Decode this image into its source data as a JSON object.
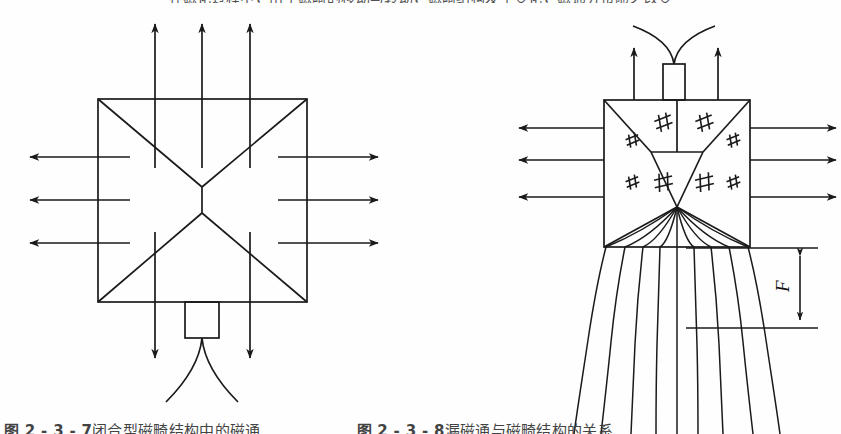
{
  "document": {
    "type": "scanned-figure",
    "page_background": "#fefefe",
    "ink_color": "#1a1a1a"
  },
  "clipped_text": {
    "top_row": "在磁化过程中，由于磁畸的移动与转动，磁畸结构发生变化，磁通分布随之改变",
    "bottom_row_left": "图 2 - 3 - 7",
    "bottom_row_left_rest": "闭合型磁畸结构中的磁通",
    "bottom_row_right": "图 2 - 3 - 8",
    "bottom_row_right_rest": "漏磁通与磁畸结构的关系"
  },
  "figure": {
    "caption_label_left": "图 2 - 3 - 7",
    "caption_label_right": "图 2 - 3 - 8",
    "dimension_label": "F"
  },
  "left_diagram": {
    "name": "closed-domain-structure",
    "square": {
      "x": 98,
      "y": 99,
      "width": 209,
      "height": 203
    },
    "center": {
      "x": 202,
      "y": 200
    },
    "wall_junction_upper": {
      "x": 202,
      "y": 187
    },
    "wall_junction_lower": {
      "x": 202,
      "y": 213
    },
    "stub_rect": {
      "x": 185,
      "y": 302,
      "width": 34,
      "height": 36
    },
    "up_arrows": [
      {
        "x": 155,
        "y_tail": 168,
        "y_head": 22
      },
      {
        "x": 202,
        "y_tail": 168,
        "y_head": 22
      },
      {
        "x": 250,
        "y_tail": 168,
        "y_head": 22
      }
    ],
    "down_arrows": [
      {
        "x": 155,
        "y_tail": 232,
        "y_head": 360
      },
      {
        "x": 250,
        "y_tail": 232,
        "y_head": 360
      }
    ],
    "left_arrows": [
      {
        "y": 157,
        "x_tail": 130,
        "x_head": 28
      },
      {
        "y": 200,
        "x_tail": 130,
        "x_head": 28
      },
      {
        "y": 243,
        "x_tail": 130,
        "x_head": 28
      }
    ],
    "right_arrows": [
      {
        "y": 157,
        "x_tail": 278,
        "x_head": 380
      },
      {
        "y": 200,
        "x_tail": 278,
        "x_head": 380
      },
      {
        "y": 243,
        "x_tail": 278,
        "x_head": 380
      }
    ],
    "leak_curves": 2,
    "arrow_counts": {
      "up": 3,
      "down": 2,
      "left": 3,
      "right": 3
    }
  },
  "right_diagram": {
    "name": "leakage-flux-domain-structure",
    "square": {
      "x": 604,
      "y": 100,
      "width": 146,
      "height": 147
    },
    "stub_rect": {
      "x": 663,
      "y": 64,
      "width": 22,
      "height": 36
    },
    "up_arrows": [
      {
        "x": 634,
        "y_tail": 100,
        "y_head": 46
      },
      {
        "x": 718,
        "y_tail": 100,
        "y_head": 46
      }
    ],
    "left_arrows": [
      {
        "y": 128,
        "x_tail": 604,
        "x_head": 517
      },
      {
        "y": 160,
        "x_tail": 604,
        "x_head": 517
      },
      {
        "y": 197,
        "x_tail": 604,
        "x_head": 517
      }
    ],
    "right_arrows": [
      {
        "y": 128,
        "x_tail": 750,
        "x_head": 838
      },
      {
        "y": 160,
        "x_tail": 750,
        "x_head": 838
      },
      {
        "y": 197,
        "x_tail": 750,
        "x_head": 838
      }
    ],
    "hash_markers": [
      {
        "x": 633,
        "y": 140,
        "size": 13,
        "rot": -18
      },
      {
        "x": 664,
        "y": 122,
        "size": 17,
        "rot": -18
      },
      {
        "x": 705,
        "y": 122,
        "size": 17,
        "rot": -18
      },
      {
        "x": 734,
        "y": 140,
        "size": 13,
        "rot": -18
      },
      {
        "x": 633,
        "y": 182,
        "size": 13,
        "rot": -18
      },
      {
        "x": 664,
        "y": 182,
        "size": 18,
        "rot": -10
      },
      {
        "x": 705,
        "y": 182,
        "size": 18,
        "rot": -10
      },
      {
        "x": 734,
        "y": 182,
        "size": 13,
        "rot": -18
      }
    ],
    "flux_line_count": 9,
    "top_leak_curves": 2,
    "dimension": {
      "label": "F",
      "x": 800,
      "y_top": 248,
      "y_bottom": 328,
      "label_x": 789,
      "label_y": 292
    },
    "arrow_counts": {
      "up": 2,
      "left": 3,
      "right": 3
    }
  }
}
